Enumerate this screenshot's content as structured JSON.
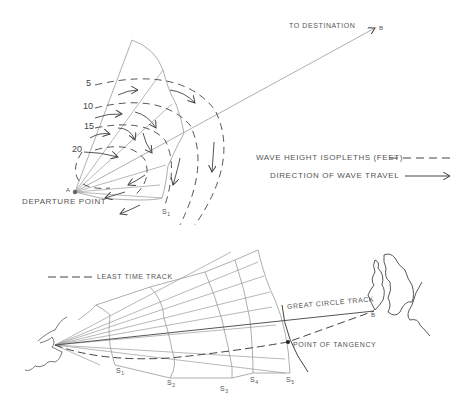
{
  "top_diagram": {
    "title": "Wave pattern fan from departure point",
    "labels": {
      "to_destination": "TO DESTINATION",
      "destination_point": "B",
      "departure_point": "DEPARTURE POINT",
      "departure_marker": "A",
      "step_label": "S",
      "step_subscript": "1"
    },
    "isopleth_values": [
      "5",
      "10",
      "15",
      "20"
    ],
    "legend": {
      "isopleth_label": "WAVE HEIGHT ISOPLETHS (FEET)",
      "direction_label": "DIRECTION OF WAVE TRAVEL"
    }
  },
  "bottom_diagram": {
    "title": "Least time track via isochrones",
    "legend": {
      "least_time_label": "LEAST TIME TRACK"
    },
    "labels": {
      "great_circle": "GREAT CIRCLE TRACK",
      "point_of_tangency": "POINT OF TANGENCY",
      "destination_marker": "B"
    },
    "isochrones": [
      {
        "label": "S",
        "sub": "1"
      },
      {
        "label": "S",
        "sub": "2"
      },
      {
        "label": "S",
        "sub": "3"
      },
      {
        "label": "S",
        "sub": "4"
      },
      {
        "label": "S",
        "sub": "5"
      }
    ]
  },
  "colors": {
    "line": "#888888",
    "dark_line": "#444444",
    "text": "#555555",
    "background": "#ffffff"
  }
}
